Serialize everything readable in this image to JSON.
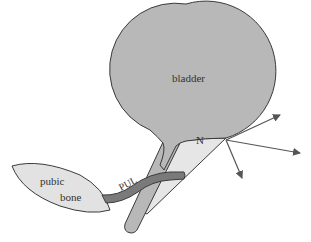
{
  "diagram": {
    "labels": {
      "bladder": "bladder",
      "neck_point": "N",
      "pubic_bone_line1": "pubic",
      "pubic_bone_line2": "bone",
      "ligament": "PUL"
    },
    "colors": {
      "background": "#ffffff",
      "bladder_fill": "#b8b8b8",
      "wedge_fill": "#e6e6e6",
      "bone_fill": "#e2e2e2",
      "ligament_fill": "#7a7a7a",
      "stroke": "#3a3a3a",
      "arrow": "#555555"
    },
    "arrows": [
      {
        "name": "arrow-up-right",
        "x1": 226,
        "y1": 140,
        "x2": 280,
        "y2": 115
      },
      {
        "name": "arrow-right",
        "x1": 226,
        "y1": 140,
        "x2": 300,
        "y2": 153
      },
      {
        "name": "arrow-down",
        "x1": 226,
        "y1": 140,
        "x2": 242,
        "y2": 178
      }
    ]
  }
}
